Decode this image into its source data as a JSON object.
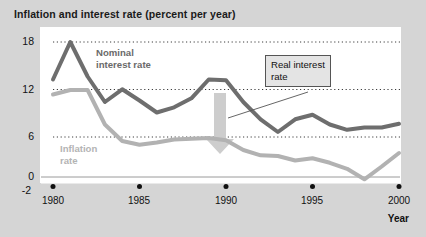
{
  "chart_data": {
    "type": "line",
    "title": "Inflation and interest rate (percent per year)",
    "xlabel": "Year",
    "ylabel": "",
    "xlim": [
      1980,
      2000
    ],
    "ylim": [
      -2,
      18
    ],
    "yticks": [
      "18",
      "12",
      "6",
      "0",
      "-2"
    ],
    "ytick_values": [
      18,
      12,
      6,
      0,
      -2
    ],
    "xticks": [
      "1980",
      "1985",
      "1990",
      "1995",
      "2000"
    ],
    "xtick_values": [
      1980,
      1985,
      1990,
      1995,
      2000
    ],
    "gridlines": "horizontal dotted at 6, 12, 18",
    "legend_position": "inline annotations",
    "x": [
      1980,
      1981,
      1982,
      1983,
      1984,
      1985,
      1986,
      1987,
      1988,
      1989,
      1990,
      1991,
      1992,
      1993,
      1994,
      1995,
      1996,
      1997,
      1998,
      1999,
      2000
    ],
    "series": [
      {
        "name": "Nominal interest rate",
        "color": "#6e6e6e",
        "values": [
          13.0,
          18.0,
          13.4,
          10.0,
          11.7,
          10.2,
          8.6,
          9.3,
          10.5,
          13.0,
          12.9,
          10.0,
          7.7,
          6.0,
          7.7,
          8.3,
          7.0,
          6.3,
          6.6,
          6.6,
          7.1
        ]
      },
      {
        "name": "Inflation rate",
        "color": "#b2b2b2",
        "values": [
          11.0,
          11.6,
          11.6,
          7.0,
          4.8,
          4.3,
          4.6,
          5.0,
          5.1,
          5.2,
          4.9,
          3.6,
          2.9,
          2.8,
          2.2,
          2.5,
          1.9,
          1.1,
          -0.3,
          1.4,
          3.2
        ]
      }
    ],
    "annotations": [
      {
        "name": "nominal-interest-rate-label",
        "text_line1": "Nominal",
        "text_line2": "interest rate"
      },
      {
        "name": "inflation-rate-label",
        "text_line1": "Inflation",
        "text_line2": "rate"
      },
      {
        "name": "real-interest-rate-callout",
        "text_line1": "Real interest",
        "text_line2": "rate"
      },
      {
        "name": "gap-arrow",
        "description": "thick light-gray down arrow between nominal and inflation curves near 1990"
      }
    ]
  },
  "colors": {
    "figure_background": "#d5d5d5",
    "plot_background": "#ffffff",
    "nominal_line": "#6e6e6e",
    "inflation_line": "#b2b2b2",
    "arrow": "#cccccc",
    "gridline": "#444444",
    "axis": "#111111"
  }
}
